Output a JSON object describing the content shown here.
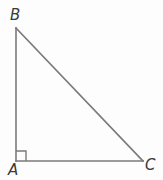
{
  "figure": {
    "name": "right-triangle-ABC",
    "background_color": "#fdfdfd",
    "stroke_color": "#7a7a7a",
    "stroke_width": 1.6,
    "label_color": "#3a3a3a",
    "vertices": [
      {
        "id": "B",
        "label": "B",
        "x": 16,
        "y": 28
      },
      {
        "id": "A",
        "label": "A",
        "x": 16,
        "y": 161
      },
      {
        "id": "C",
        "label": "C",
        "x": 143,
        "y": 161
      }
    ],
    "sides": [
      {
        "id": "AB",
        "from": "A",
        "to": "B",
        "role": "vertical-leg"
      },
      {
        "id": "AC",
        "from": "A",
        "to": "C",
        "role": "horizontal-leg"
      },
      {
        "id": "BC",
        "from": "B",
        "to": "C",
        "role": "hypotenuse"
      }
    ],
    "right_angle_marker": {
      "at_vertex": "A",
      "size": 10,
      "x": 16,
      "y": 151
    }
  }
}
